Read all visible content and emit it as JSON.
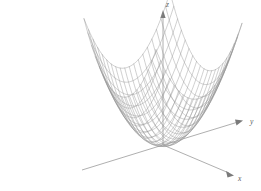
{
  "figure": {
    "title": "",
    "background_color": "#ffffff",
    "mesh_color": "#8c8c8c",
    "axis_color": "#8a8a8a",
    "label_color": "#5a5a5a"
  },
  "axes": {
    "x": {
      "label": "x",
      "label_x": 238,
      "label_y": 181
    },
    "y": {
      "label": "y",
      "label_x": 250,
      "label_y": 124
    },
    "z": {
      "label": "z",
      "label_x": 166,
      "label_y": 7
    }
  },
  "chart_data": {
    "type": "surface",
    "title": "",
    "xlabel": "x",
    "ylabel": "y",
    "zlabel": "z",
    "function": "z = x^2 + y^2",
    "surface_name": "elliptic-paraboloid",
    "grid": true,
    "legend": false,
    "u_divisions": 19,
    "v_divisions": 19,
    "xlim": [
      -1,
      1
    ],
    "ylim": [
      -1,
      1
    ],
    "zlim": [
      0,
      2
    ],
    "projection": {
      "origin_px": [
        163,
        145
      ],
      "x_axis_end_px": [
        233,
        175
      ],
      "y_axis_end_px": [
        243,
        122
      ],
      "z_axis_end_px": [
        163,
        12
      ]
    }
  }
}
